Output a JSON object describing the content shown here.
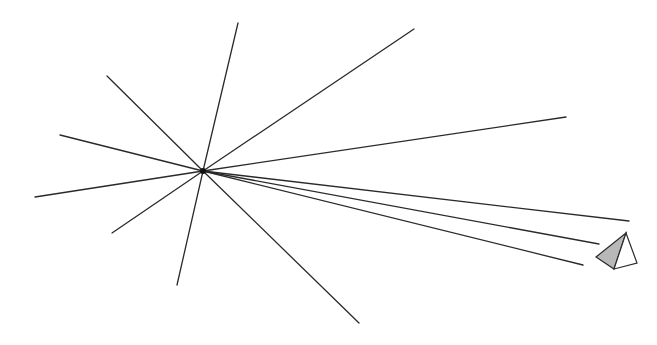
{
  "diagram": {
    "canvas": {
      "width": 657,
      "height": 345,
      "background": "#ffffff"
    },
    "stroke_color": "#2a2a2a",
    "center": {
      "x": 203,
      "y": 171
    },
    "rays": [
      {
        "name": "ray-up",
        "x2": 238,
        "y2": 23
      },
      {
        "name": "ray-upper-left",
        "x2": 107,
        "y2": 76
      },
      {
        "name": "ray-left",
        "x2": 60,
        "y2": 135
      },
      {
        "name": "ray-far-left-down",
        "x2": 35,
        "y2": 197
      },
      {
        "name": "ray-lower-left",
        "x2": 112,
        "y2": 233
      },
      {
        "name": "ray-down",
        "x2": 177,
        "y2": 285
      },
      {
        "name": "ray-lower-right",
        "x2": 359,
        "y2": 323
      },
      {
        "name": "ray-upper-right",
        "x2": 414,
        "y2": 29
      },
      {
        "name": "ray-right",
        "x2": 566,
        "y2": 117
      },
      {
        "name": "ray-to-pyramid-1",
        "x2": 629,
        "y2": 221
      },
      {
        "name": "ray-to-pyramid-2",
        "x2": 599,
        "y2": 244
      },
      {
        "name": "ray-to-pyramid-3",
        "x2": 583,
        "y2": 265
      }
    ],
    "pyramid": {
      "apex": {
        "x": 626,
        "y": 233
      },
      "left": {
        "x": 596,
        "y": 257
      },
      "bottom": {
        "x": 614,
        "y": 269
      },
      "right": {
        "x": 637,
        "y": 263
      },
      "shaded_face_color": "#b8b8b8",
      "light_face_color": "#ffffff"
    }
  }
}
